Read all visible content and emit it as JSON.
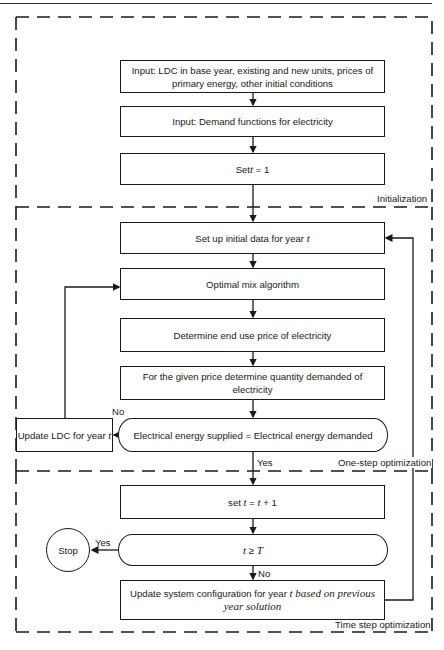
{
  "sections": {
    "initialization": "Initialization",
    "one_step": "One-step optimization",
    "time_step": "Time step optimization"
  },
  "init": {
    "box1_line1": "Input: LDC in base year, existing and new units, prices of",
    "box1_line2": "primary energy, other initial conditions",
    "box2": "Input: Demand functions for electricity",
    "box3_pre": "Set ",
    "box3_var": "t",
    "box3_post": " = 1"
  },
  "one_step": {
    "setup_pre": "Set up initial data for year ",
    "setup_var": "t",
    "optimal": "Optimal mix algorithm",
    "price": "Determine end use price of electricity",
    "quantity": "For the given price determine quantity demanded of electricity",
    "decision": "Electrical energy supplied = Electrical energy demanded",
    "update_ldc_pre": "Update LDC for year ",
    "update_ldc_var": "t",
    "no_label": "No",
    "yes_label": "Yes"
  },
  "time_step": {
    "inc_pre": "set ",
    "inc_var1": "t",
    "inc_mid": " = ",
    "inc_var2": "t",
    "inc_post": " + 1",
    "cond_var1": "t",
    "cond_op": " ≥ ",
    "cond_var2": "T",
    "stop": "Stop",
    "yes_label": "Yes",
    "no_label": "No",
    "update_pre": "Update system configuration for year ",
    "update_var": "t",
    "update_italic": " based on previous",
    "update_line2": "year solution"
  }
}
